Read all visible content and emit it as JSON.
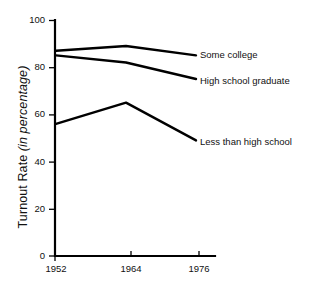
{
  "chart_data": {
    "type": "line",
    "title": "",
    "xlabel": "",
    "ylabel": "Turnout Rate (in percentage)",
    "ylabel_main": "Turnout Rate",
    "ylabel_unit": "(in percentage)",
    "categories": [
      "1952",
      "1964",
      "1976"
    ],
    "x": [
      1952,
      1964,
      1976
    ],
    "xlim": [
      1952,
      1976
    ],
    "ylim": [
      0,
      100
    ],
    "ytick_labels": [
      "100",
      "80",
      "60",
      "40",
      "20",
      "0"
    ],
    "yticks": [
      100,
      80,
      60,
      40,
      20,
      0
    ],
    "xtick_labels": [
      "1952",
      "1964",
      "1976"
    ],
    "grid": false,
    "legend_position": "right-inline",
    "line_color": "#000000",
    "series": [
      {
        "name": "Some college",
        "values": [
          87,
          89,
          85
        ]
      },
      {
        "name": "High school graduate",
        "values": [
          85,
          82,
          75
        ]
      },
      {
        "name": "Less than high school",
        "values": [
          56,
          65,
          49
        ]
      }
    ]
  },
  "annotations": {
    "series_labels": [
      "Some college",
      "High school graduate",
      "Less than high school"
    ]
  }
}
